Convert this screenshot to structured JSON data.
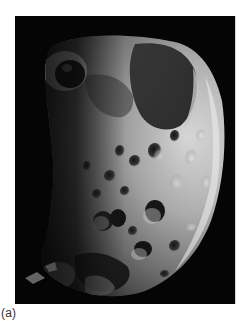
{
  "figure": {
    "panel_label": "(a)",
    "image": {
      "subject": "cratered-moon",
      "description": "Grayscale photograph of a heavily cratered, irregular moon against a black background, lit from the right",
      "background_color": "#050505",
      "surface_highlight_color": "#e6e6e6",
      "surface_shadow_color": "#1a1a1a"
    }
  }
}
